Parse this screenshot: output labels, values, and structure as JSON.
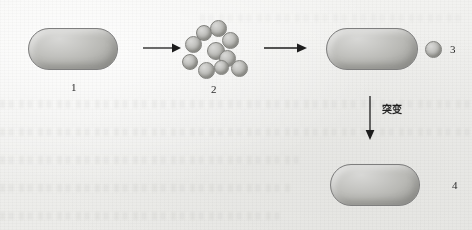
{
  "figure": {
    "type": "biology-process-diagram",
    "background_color": "#efefed",
    "cell_fill_color": "#bdbdb9",
    "outline_color": "#2e2e2e"
  },
  "labels": {
    "item1": "1",
    "item2": "2",
    "item3": "3",
    "item4": "4",
    "mutation": "突变"
  },
  "stages": [
    {
      "id": "stage-1",
      "label": "1",
      "kind": "bacterium",
      "receptors": "y-shaped",
      "receptor_count": 6,
      "bound_particle": false
    },
    {
      "id": "stage-2",
      "label": "2",
      "kind": "particle-cluster",
      "particle_count": 10,
      "particle_shape": "sphere"
    },
    {
      "id": "stage-3",
      "label": "3",
      "kind": "bacterium",
      "receptors": "y-shaped",
      "receptor_count": 6,
      "bound_particle": true
    },
    {
      "id": "stage-4",
      "label": "4",
      "kind": "bacterium",
      "receptors": "bent-hook",
      "receptor_count": 6,
      "bound_particle": false
    }
  ],
  "arrows": [
    {
      "id": "arrow-1-to-2",
      "direction": "right"
    },
    {
      "id": "arrow-2-to-3",
      "direction": "right"
    },
    {
      "id": "arrow-3-to-4",
      "direction": "down",
      "annotation": "突变"
    }
  ],
  "particles": [
    {
      "cx": 203,
      "cy": 32,
      "r": 7.0
    },
    {
      "cx": 218,
      "cy": 28,
      "r": 7.5
    },
    {
      "cx": 193,
      "cy": 44,
      "r": 7.5
    },
    {
      "cx": 230,
      "cy": 40,
      "r": 7.5
    },
    {
      "cx": 215,
      "cy": 50,
      "r": 8.0
    },
    {
      "cx": 227,
      "cy": 58,
      "r": 7.5
    },
    {
      "cx": 189,
      "cy": 61,
      "r": 7.0
    },
    {
      "cx": 206,
      "cy": 70,
      "r": 7.5
    },
    {
      "cx": 239,
      "cy": 68,
      "r": 7.5
    },
    {
      "cx": 221,
      "cy": 66,
      "r": 6.5
    }
  ]
}
